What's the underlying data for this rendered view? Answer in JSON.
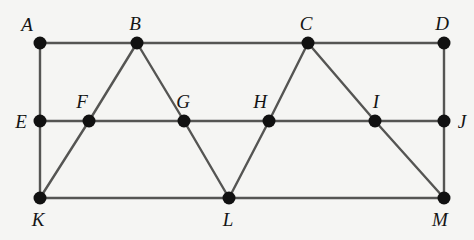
{
  "figure": {
    "type": "geometric-diagram",
    "background_color": "#f5f5f3",
    "line_color": "#555553",
    "vertex_color": "#111111",
    "label_color": "#141414",
    "width": 474,
    "height": 240,
    "vertex_radius": 6.5,
    "line_width": 2.4
  },
  "geometry": {
    "rows": {
      "top_y": 43,
      "middle_y": 121,
      "bottom_y": 198
    },
    "vertices": [
      {
        "id": "A",
        "label": "A",
        "x": 40,
        "y": 43,
        "row": "top",
        "label_dx": -13,
        "label_dy": -19
      },
      {
        "id": "B",
        "label": "B",
        "x": 137,
        "y": 43,
        "row": "top",
        "label_dx": -2,
        "label_dy": -20
      },
      {
        "id": "C",
        "label": "C",
        "x": 308,
        "y": 43,
        "row": "top",
        "label_dx": -2,
        "label_dy": -20
      },
      {
        "id": "D",
        "label": "D",
        "x": 444,
        "y": 43,
        "row": "top",
        "label_dx": -2,
        "label_dy": -20
      },
      {
        "id": "E",
        "label": "E",
        "x": 40,
        "y": 121,
        "row": "middle",
        "label_dx": -19,
        "label_dy": 0
      },
      {
        "id": "F",
        "label": "F",
        "x": 89,
        "y": 121,
        "row": "middle",
        "label_dx": -7,
        "label_dy": -20
      },
      {
        "id": "G",
        "label": "G",
        "x": 184,
        "y": 121,
        "row": "middle",
        "label_dx": -1,
        "label_dy": -20
      },
      {
        "id": "H",
        "label": "H",
        "x": 269,
        "y": 121,
        "row": "middle",
        "label_dx": -9,
        "label_dy": -20
      },
      {
        "id": "I",
        "label": "I",
        "x": 375,
        "y": 121,
        "row": "middle",
        "label_dx": 1,
        "label_dy": -20
      },
      {
        "id": "J",
        "label": "J",
        "x": 444,
        "y": 121,
        "row": "middle",
        "label_dx": 18,
        "label_dy": 0
      },
      {
        "id": "K",
        "label": "K",
        "x": 40,
        "y": 198,
        "row": "bottom",
        "label_dx": -2,
        "label_dy": 21
      },
      {
        "id": "L",
        "label": "L",
        "x": 229,
        "y": 198,
        "row": "bottom",
        "label_dx": -1,
        "label_dy": 21
      },
      {
        "id": "M",
        "label": "M",
        "x": 444,
        "y": 198,
        "row": "bottom",
        "label_dx": -4,
        "label_dy": 21
      }
    ],
    "edges": [
      {
        "id": "edge-A-D",
        "name": "top-horizontal",
        "from": "A",
        "to": "D"
      },
      {
        "id": "edge-E-J",
        "name": "middle-horizontal",
        "from": "E",
        "to": "J"
      },
      {
        "id": "edge-K-M",
        "name": "bottom-horizontal",
        "from": "K",
        "to": "M"
      },
      {
        "id": "edge-A-E",
        "name": "left-vertical-upper",
        "from": "A",
        "to": "E"
      },
      {
        "id": "edge-E-K",
        "name": "left-vertical-lower",
        "from": "E",
        "to": "K"
      },
      {
        "id": "edge-D-J",
        "name": "right-vertical-upper",
        "from": "D",
        "to": "J"
      },
      {
        "id": "edge-J-M",
        "name": "right-vertical-lower",
        "from": "J",
        "to": "M"
      },
      {
        "id": "edge-K-F",
        "name": "diagonal-K-F",
        "from": "K",
        "to": "F"
      },
      {
        "id": "edge-F-B",
        "name": "diagonal-F-B",
        "from": "F",
        "to": "B"
      },
      {
        "id": "edge-B-G",
        "name": "diagonal-B-G",
        "from": "B",
        "to": "G"
      },
      {
        "id": "edge-G-L",
        "name": "diagonal-G-L",
        "from": "G",
        "to": "L"
      },
      {
        "id": "edge-L-H",
        "name": "diagonal-L-H",
        "from": "L",
        "to": "H"
      },
      {
        "id": "edge-H-C",
        "name": "diagonal-H-C",
        "from": "H",
        "to": "C"
      },
      {
        "id": "edge-C-I",
        "name": "diagonal-C-I",
        "from": "C",
        "to": "I"
      },
      {
        "id": "edge-I-M",
        "name": "diagonal-I-M",
        "from": "I",
        "to": "M"
      }
    ]
  }
}
